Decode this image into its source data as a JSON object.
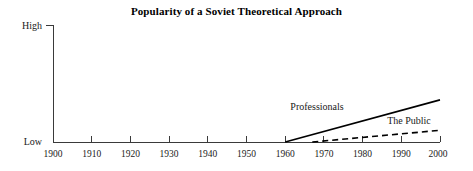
{
  "chart_data": {
    "type": "line",
    "title": "Popularity of a Soviet Theoretical Approach",
    "xlabel": "",
    "ylabel": "",
    "grid": false,
    "legend_position": "inline-annotation",
    "xlim": [
      1900,
      2000
    ],
    "ylim": [
      0,
      1
    ],
    "x_tick_labels": [
      "1900",
      "1910",
      "1920",
      "1930",
      "1940",
      "1950",
      "1960",
      "1970",
      "1980",
      "1990",
      "2000"
    ],
    "x_ticks": [
      1900,
      1910,
      1920,
      1930,
      1940,
      1950,
      1960,
      1970,
      1980,
      1990,
      2000
    ],
    "y_tick_labels": [
      "Low",
      "High"
    ],
    "y_ticks": [
      0,
      1
    ],
    "series": [
      {
        "name": "Professionals",
        "style": "solid",
        "color": "#000000",
        "x": [
          1960,
          2000
        ],
        "values": [
          0.0,
          0.36
        ]
      },
      {
        "name": "The Public",
        "style": "dashed",
        "color": "#000000",
        "x": [
          1967,
          2000
        ],
        "values": [
          0.0,
          0.1
        ]
      }
    ],
    "annotations": [
      {
        "text": "Professionals",
        "x": 1978,
        "y": 0.3
      },
      {
        "text": "The Public",
        "x": 1990,
        "y": 0.18
      }
    ]
  },
  "axes": {
    "y_high_label": "High",
    "y_low_label": "Low"
  },
  "ticks": {
    "t0": "1900",
    "t1": "1910",
    "t2": "1920",
    "t3": "1930",
    "t4": "1940",
    "t5": "1950",
    "t6": "1960",
    "t7": "1970",
    "t8": "1980",
    "t9": "1990",
    "t10": "2000"
  },
  "annotations": {
    "professionals": "Professionals",
    "the_public": "The Public"
  }
}
